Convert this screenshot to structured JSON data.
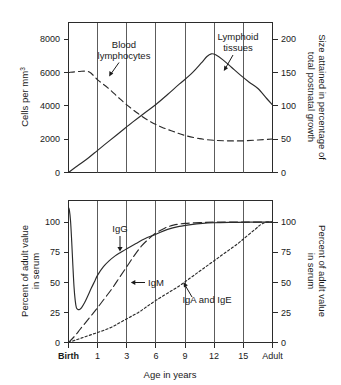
{
  "chart_data": [
    {
      "type": "line",
      "id": "lymphoid-development",
      "title": "",
      "xlabel": "",
      "ylabel": "Cells per mm3",
      "ylabel_display": "Cells per mm",
      "ylabel_superscript": "3",
      "y2label": "Size attained in percentage of total postnatal growth",
      "x_categories": [
        "Birth",
        "1",
        "3",
        "6",
        "9",
        "12",
        "15",
        "Adult"
      ],
      "xlim": [
        0,
        7
      ],
      "ylim": [
        0,
        9000
      ],
      "yticks": [
        0,
        2000,
        4000,
        6000,
        8000
      ],
      "yticklabels": [
        "0",
        "2000",
        "4000",
        "6000",
        "8000"
      ],
      "y2lim": [
        0,
        225
      ],
      "y2ticks": [
        0,
        50,
        100,
        150,
        200
      ],
      "y2ticklabels": [
        "0",
        "50",
        "100",
        "150",
        "200"
      ],
      "grid": true,
      "legend": "annotations",
      "series": [
        {
          "name": "Blood lymphocytes",
          "style": "dashed",
          "points": [
            [
              0.0,
              6000
            ],
            [
              0.35,
              6060
            ],
            [
              0.7,
              6040
            ],
            [
              1.0,
              5560
            ],
            [
              1.35,
              5080
            ],
            [
              1.7,
              4520
            ],
            [
              2.0,
              4060
            ],
            [
              2.4,
              3520
            ],
            [
              2.8,
              3060
            ],
            [
              3.2,
              2720
            ],
            [
              3.6,
              2460
            ],
            [
              4.0,
              2220
            ],
            [
              4.5,
              2030
            ],
            [
              5.0,
              1930
            ],
            [
              5.5,
              1900
            ],
            [
              6.0,
              1900
            ],
            [
              6.5,
              1950
            ],
            [
              7.0,
              2010
            ]
          ]
        },
        {
          "name": "Lymphoid tissues",
          "style": "solid",
          "points": [
            [
              0.0,
              0
            ],
            [
              0.3,
              390
            ],
            [
              0.7,
              900
            ],
            [
              1.0,
              1330
            ],
            [
              1.4,
              1900
            ],
            [
              1.8,
              2460
            ],
            [
              2.2,
              3020
            ],
            [
              2.6,
              3560
            ],
            [
              3.0,
              4080
            ],
            [
              3.4,
              4680
            ],
            [
              3.8,
              5300
            ],
            [
              4.2,
              5900
            ],
            [
              4.55,
              6560
            ],
            [
              4.75,
              6960
            ],
            [
              4.9,
              7120
            ],
            [
              5.05,
              7060
            ],
            [
              5.3,
              6760
            ],
            [
              5.6,
              6300
            ],
            [
              5.9,
              5840
            ],
            [
              6.2,
              5420
            ],
            [
              6.5,
              5040
            ],
            [
              6.8,
              4440
            ],
            [
              7.0,
              4060
            ]
          ]
        }
      ],
      "annotations": [
        {
          "text_lines": [
            "Blood",
            "lymphocytes"
          ],
          "target": "Blood lymphocytes"
        },
        {
          "text_lines": [
            "Lymphoid",
            "tissues"
          ],
          "target": "Lymphoid tissues"
        }
      ]
    },
    {
      "type": "line",
      "id": "immunoglobulin-levels",
      "title": "",
      "xlabel": "Age in years",
      "ylabel": "Percent of adult value in serum",
      "y2label": "Percent of adult value in serum",
      "x_categories": [
        "Birth",
        "1",
        "3",
        "6",
        "9",
        "12",
        "15",
        "Adult"
      ],
      "xlim": [
        0,
        7
      ],
      "ylim": [
        0,
        118
      ],
      "yticks": [
        0,
        25,
        50,
        75,
        100
      ],
      "yticklabels": [
        "0",
        "25",
        "50",
        "75",
        "100"
      ],
      "y2ticks": [
        0,
        25,
        50,
        75,
        100
      ],
      "y2ticklabels": [
        "0",
        "25",
        "50",
        "75",
        "100"
      ],
      "grid": true,
      "legend": "annotations",
      "series": [
        {
          "name": "IgG",
          "style": "solid",
          "points": [
            [
              0.0,
              112
            ],
            [
              0.03,
              110
            ],
            [
              0.07,
              101
            ],
            [
              0.11,
              84
            ],
            [
              0.15,
              64
            ],
            [
              0.19,
              46
            ],
            [
              0.23,
              35
            ],
            [
              0.27,
              29
            ],
            [
              0.32,
              27.5
            ],
            [
              0.38,
              27.5
            ],
            [
              0.45,
              29
            ],
            [
              0.55,
              33
            ],
            [
              0.65,
              38
            ],
            [
              0.78,
              45
            ],
            [
              0.9,
              51
            ],
            [
              1.0,
              56
            ],
            [
              1.2,
              63
            ],
            [
              1.4,
              68
            ],
            [
              1.6,
              72
            ],
            [
              1.8,
              75
            ],
            [
              2.0,
              78
            ],
            [
              2.3,
              82
            ],
            [
              2.6,
              86
            ],
            [
              3.0,
              90
            ],
            [
              3.4,
              94
            ],
            [
              3.8,
              96.5
            ],
            [
              4.2,
              98
            ],
            [
              4.6,
              99
            ],
            [
              5.0,
              99.5
            ],
            [
              5.6,
              99.8
            ],
            [
              6.2,
              100
            ],
            [
              7.0,
              100
            ]
          ]
        },
        {
          "name": "IgM",
          "style": "longdash",
          "points": [
            [
              0.0,
              0
            ],
            [
              0.2,
              5
            ],
            [
              0.4,
              11
            ],
            [
              0.6,
              17
            ],
            [
              0.8,
              23
            ],
            [
              1.0,
              29
            ],
            [
              1.25,
              37
            ],
            [
              1.5,
              45
            ],
            [
              1.75,
              54
            ],
            [
              2.0,
              63
            ],
            [
              2.25,
              72
            ],
            [
              2.5,
              80
            ],
            [
              2.75,
              86
            ],
            [
              3.0,
              91
            ],
            [
              3.3,
              95
            ],
            [
              3.6,
              97.5
            ],
            [
              4.0,
              99
            ],
            [
              4.5,
              99.6
            ],
            [
              5.0,
              100
            ],
            [
              6.0,
              100
            ],
            [
              7.0,
              100
            ]
          ]
        },
        {
          "name": "IgA and IgE",
          "style": "dotted",
          "points": [
            [
              0.0,
              0
            ],
            [
              0.3,
              2.5
            ],
            [
              0.6,
              5
            ],
            [
              0.9,
              7.5
            ],
            [
              1.2,
              10
            ],
            [
              1.5,
              13
            ],
            [
              1.8,
              17
            ],
            [
              2.1,
              21
            ],
            [
              2.4,
              25
            ],
            [
              2.7,
              30
            ],
            [
              3.0,
              35
            ],
            [
              3.4,
              41
            ],
            [
              3.8,
              47
            ],
            [
              4.2,
              54
            ],
            [
              4.6,
              61
            ],
            [
              5.0,
              68
            ],
            [
              5.4,
              75
            ],
            [
              5.8,
              82
            ],
            [
              6.1,
              88
            ],
            [
              6.4,
              94
            ],
            [
              6.6,
              98
            ],
            [
              6.8,
              100
            ],
            [
              7.0,
              100
            ]
          ]
        }
      ],
      "annotations": [
        {
          "text_lines": [
            "IgG"
          ],
          "target": "IgG"
        },
        {
          "text_lines": [
            "IgM"
          ],
          "target": "IgM"
        },
        {
          "text_lines": [
            "IgA and IgE"
          ],
          "target": "IgA and IgE"
        }
      ]
    }
  ],
  "top_chart": {
    "y_axis_title_main": "Cells per mm",
    "y_axis_title_sup": "3",
    "y2_axis_title_line1": "Size attained in percentage of",
    "y2_axis_title_line2": "total postnatal growth",
    "yticks": [
      "8000",
      "6000",
      "4000",
      "2000",
      "0"
    ],
    "y2ticks": [
      "200",
      "150",
      "100",
      "50",
      "0"
    ],
    "ann_blood_line1": "Blood",
    "ann_blood_line2": "lymphocytes",
    "ann_lymphoid_line1": "Lymphoid",
    "ann_lymphoid_line2": "tissues"
  },
  "bottom_chart": {
    "y_axis_title_line1": "Percent of adult value",
    "y_axis_title_line2": "in serum",
    "y2_axis_title_line1": "Percent of adult value",
    "y2_axis_title_line2": "in serum",
    "yticks": [
      "100",
      "75",
      "50",
      "25",
      "0"
    ],
    "y2ticks": [
      "100",
      "75",
      "50",
      "25",
      "0"
    ],
    "ann_igg": "IgG",
    "ann_igm": "IgM",
    "ann_iga_ige": "IgA and IgE",
    "x_axis_title": "Age in years",
    "xticklabels": [
      "Birth",
      "1",
      "3",
      "6",
      "9",
      "12",
      "15",
      "Adult"
    ]
  }
}
